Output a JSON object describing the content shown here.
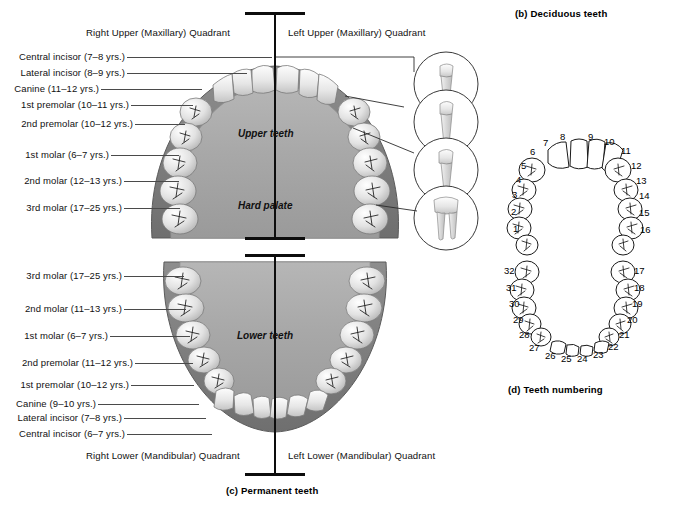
{
  "figure": {
    "panel_b_caption": "(b) Deciduous teeth",
    "panel_c_caption": "(c) Permanent teeth",
    "panel_d_caption": "(d) Teeth numbering"
  },
  "quadrants": {
    "right_upper": "Right Upper (Maxillary) Quadrant",
    "left_upper": "Left Upper (Maxillary) Quadrant",
    "right_lower": "Right Lower (Mandibular) Quadrant",
    "left_lower": "Left Lower (Mandibular) Quadrant"
  },
  "inner_labels": {
    "upper_teeth": "Upper teeth",
    "hard_palate": "Hard palate",
    "lower_teeth": "Lower teeth"
  },
  "upper_labels": [
    {
      "text": "Central incisor (7–8 yrs.)",
      "y": 57,
      "line_x": 125,
      "line_w": 145
    },
    {
      "text": "Lateral incisor (8–9 yrs.)",
      "y": 73,
      "line_x": 125,
      "line_w": 120
    },
    {
      "text": "Canine (11–12 yrs.)",
      "y": 89,
      "line_x": 99,
      "line_w": 101
    },
    {
      "text": "1st premolar (10–11 yrs.)",
      "y": 105,
      "line_x": 129,
      "line_w": 62
    },
    {
      "text": "2nd premolar (10–12 yrs.)",
      "y": 124,
      "line_x": 133,
      "line_w": 50
    },
    {
      "text": "1st molar (6–7 yrs.)",
      "y": 155,
      "line_x": 109,
      "line_w": 68
    },
    {
      "text": "2nd molar (12–13 yrs.)",
      "y": 181,
      "line_x": 122,
      "line_w": 55
    },
    {
      "text": "3rd molar (17–25 yrs.)",
      "y": 208,
      "line_x": 122,
      "line_w": 56
    }
  ],
  "lower_labels": [
    {
      "text": "3rd molar (17–25 yrs.)",
      "y": 276,
      "line_x": 122,
      "line_w": 60
    },
    {
      "text": "2nd molar (11–13 yrs.)",
      "y": 309,
      "line_x": 122,
      "line_w": 62
    },
    {
      "text": "1st molar (6–7 yrs.)",
      "y": 336,
      "line_x": 108,
      "line_w": 80
    },
    {
      "text": "2nd premolar (11–12 yrs.)",
      "y": 363,
      "line_x": 133,
      "line_w": 58
    },
    {
      "text": "1st premolar (10–12 yrs.)",
      "y": 385,
      "line_x": 129,
      "line_w": 63
    },
    {
      "text": "Canine (9–10 yrs.)",
      "y": 404,
      "line_x": 96,
      "line_w": 101
    },
    {
      "text": "Lateral incisor (7–8 yrs.)",
      "y": 418,
      "line_x": 122,
      "line_w": 82
    },
    {
      "text": "Central incisor (6–7 yrs.)",
      "y": 434,
      "line_x": 125,
      "line_w": 85
    }
  ],
  "numbering": {
    "upper_right": [
      {
        "n": "1",
        "x": 513,
        "y": 223
      },
      {
        "n": "2",
        "x": 511,
        "y": 206
      },
      {
        "n": "3",
        "x": 512,
        "y": 189
      },
      {
        "n": "4",
        "x": 516,
        "y": 174
      },
      {
        "n": "5",
        "x": 521,
        "y": 160
      },
      {
        "n": "6",
        "x": 530,
        "y": 146
      },
      {
        "n": "7",
        "x": 543,
        "y": 137
      },
      {
        "n": "8",
        "x": 560,
        "y": 131
      }
    ],
    "upper_left": [
      {
        "n": "9",
        "x": 588,
        "y": 131
      },
      {
        "n": "10",
        "x": 604,
        "y": 136
      },
      {
        "n": "11",
        "x": 621,
        "y": 145
      },
      {
        "n": "12",
        "x": 631,
        "y": 160
      },
      {
        "n": "13",
        "x": 636,
        "y": 175
      },
      {
        "n": "14",
        "x": 639,
        "y": 190
      },
      {
        "n": "15",
        "x": 639,
        "y": 207
      },
      {
        "n": "16",
        "x": 640,
        "y": 224
      }
    ],
    "lower_right": [
      {
        "n": "32",
        "x": 504,
        "y": 265
      },
      {
        "n": "31",
        "x": 506,
        "y": 282
      },
      {
        "n": "30",
        "x": 509,
        "y": 298
      },
      {
        "n": "29",
        "x": 513,
        "y": 314
      },
      {
        "n": "28",
        "x": 519,
        "y": 329
      },
      {
        "n": "27",
        "x": 529,
        "y": 342
      },
      {
        "n": "26",
        "x": 545,
        "y": 350
      },
      {
        "n": "25",
        "x": 561,
        "y": 353
      }
    ],
    "lower_left": [
      {
        "n": "24",
        "x": 577,
        "y": 353
      },
      {
        "n": "23",
        "x": 593,
        "y": 349
      },
      {
        "n": "22",
        "x": 608,
        "y": 341
      },
      {
        "n": "21",
        "x": 619,
        "y": 329
      },
      {
        "n": "20",
        "x": 627,
        "y": 314
      },
      {
        "n": "19",
        "x": 632,
        "y": 298
      },
      {
        "n": "18",
        "x": 634,
        "y": 282
      },
      {
        "n": "17",
        "x": 634,
        "y": 265
      }
    ]
  },
  "callouts": [
    {
      "name": "incisor-profile",
      "cy": 84
    },
    {
      "name": "canine-profile",
      "cy": 122
    },
    {
      "name": "premolar-profile",
      "cy": 170
    },
    {
      "name": "molar-profile",
      "cy": 218
    }
  ]
}
